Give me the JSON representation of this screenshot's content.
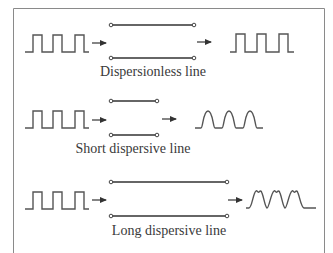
{
  "diagram": {
    "colors": {
      "stroke": "#555555",
      "border": "#8a8a8a",
      "text": "#3a3a3a",
      "background": "#ffffff"
    },
    "rows": [
      {
        "id": "dispersionless",
        "label": "Dispersionless line",
        "input_waveform": "square-pulse-train",
        "output_waveform": "square-pulse-train",
        "pulse_count": 3
      },
      {
        "id": "short-dispersive",
        "label": "Short dispersive line",
        "input_waveform": "square-pulse-train",
        "output_waveform": "rounded-pulse-train",
        "pulse_count": 3
      },
      {
        "id": "long-dispersive",
        "label": "Long dispersive line",
        "input_waveform": "square-pulse-train",
        "output_waveform": "distorted-pulse-train-with-ripple",
        "pulse_count": 3
      }
    ]
  }
}
